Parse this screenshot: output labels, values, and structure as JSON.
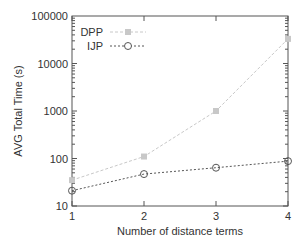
{
  "chart_data": {
    "type": "line",
    "title": "",
    "xlabel": "Number of distance terms",
    "ylabel": "AVG Total Time (s)",
    "x": [
      1,
      2,
      3,
      4
    ],
    "xticks": [
      "1",
      "2",
      "3",
      "4"
    ],
    "yscale": "log",
    "ylim": [
      10,
      100000
    ],
    "yticks": [
      "10",
      "100",
      "1000",
      "10000",
      "100000"
    ],
    "grid": false,
    "legend_position": "upper left",
    "series": [
      {
        "name": "DPP",
        "values": [
          35,
          110,
          1000,
          33000
        ],
        "color": "#c8c8c8",
        "marker": "square",
        "line": "dashed"
      },
      {
        "name": "IJP",
        "values": [
          21,
          47,
          64,
          88
        ],
        "color": "#555555",
        "marker": "circle-open",
        "line": "dotted"
      }
    ]
  }
}
